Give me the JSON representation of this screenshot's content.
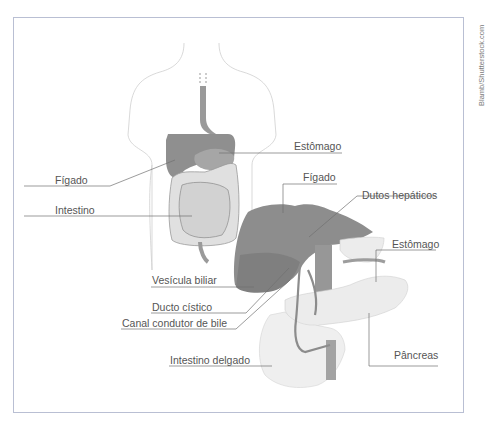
{
  "credit": "Blamb/Shutterstock.com",
  "labels": {
    "estomago_top": "Estômago",
    "figado_left": "Fígado",
    "intestino": "Intestino",
    "figado_right": "Fígado",
    "dutos_hepaticos": "Dutos hepáticos",
    "estomago_right": "Estômago",
    "vesicula_biliar": "Vesícula biliar",
    "ducto_cistico": "Ducto cístico",
    "canal_condutor": "Canal condutor de bile",
    "pancreas": "Pâncreas",
    "intestino_delgado": "Intestino delgado"
  },
  "colors": {
    "frame": "#b9bfd3",
    "organ_dark": "#8e8e8e",
    "organ_light": "#e2e2e2",
    "outline": "#c8c8c8",
    "leader": "#666666"
  }
}
